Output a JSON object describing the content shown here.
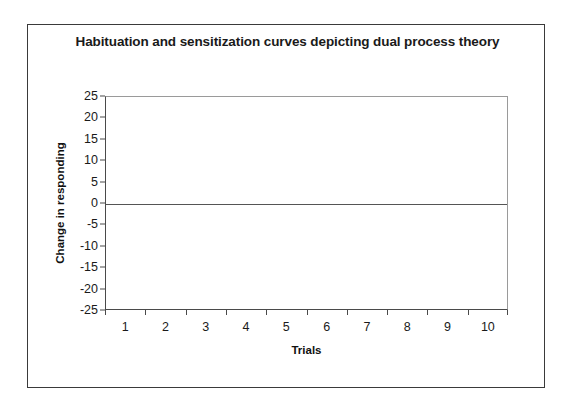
{
  "chart_data": {
    "type": "line",
    "title": "Habituation and sensitization curves depicting dual process theory",
    "xlabel": "Trials",
    "ylabel": "Change in responding",
    "categories": [
      "1",
      "2",
      "3",
      "4",
      "5",
      "6",
      "7",
      "8",
      "9",
      "10"
    ],
    "x": [
      1,
      2,
      3,
      4,
      5,
      6,
      7,
      8,
      9,
      10
    ],
    "xlim": [
      0.5,
      10.5
    ],
    "ylim": [
      -25,
      25
    ],
    "yticks": [
      25,
      20,
      15,
      10,
      5,
      0,
      -5,
      -10,
      -15,
      -20,
      -25
    ],
    "ytick_labels": [
      "25",
      "20",
      "15",
      "10",
      "5",
      "0",
      "-5",
      "-10",
      "-15",
      "-20",
      "-25"
    ],
    "grid": false,
    "legend": null,
    "series": [],
    "annotations": [
      {
        "name": "zero-reference-line",
        "type": "horizontal-line",
        "value": 0,
        "color": "#555555"
      }
    ],
    "colors": {
      "background": "#ffffff",
      "outer_border": "#3a3a3a",
      "plot_border": "#9a9a9a",
      "axis": "#4a4a4a",
      "text": "#1a1a1a",
      "zero_line": "#555555"
    }
  }
}
